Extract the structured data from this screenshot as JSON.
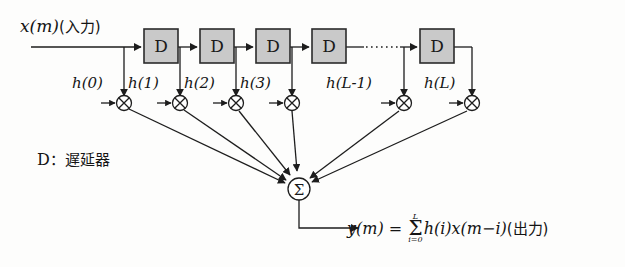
{
  "figure": {
    "type": "block-diagram",
    "title_role": "FIR digital filter (transversal filter) block diagram",
    "input_label": "x(m)(入力)",
    "input_signal": "x(m)",
    "input_annotation": "(入力)",
    "legend": "D：遅延器",
    "legend_symbol": "D",
    "legend_meaning": "遅延器",
    "delay_block_label": "D",
    "delay_blocks": [
      {
        "label": "D",
        "index": 1
      },
      {
        "label": "D",
        "index": 2
      },
      {
        "label": "D",
        "index": 3
      },
      {
        "label": "D",
        "index": 4
      },
      {
        "label": "D",
        "index": 5
      }
    ],
    "ellipsis": "……",
    "coefficients": [
      {
        "label": "h(0)",
        "index": 0
      },
      {
        "label": "h(1)",
        "index": 1
      },
      {
        "label": "h(2)",
        "index": 2
      },
      {
        "label": "h(3)",
        "index": 3
      },
      {
        "label": "h(L-1)",
        "index": 4
      },
      {
        "label": "h(L)",
        "index": 5
      }
    ],
    "multiplier_symbol": "⊗",
    "summation_symbol": "Σ",
    "output": {
      "signal": "y(m)",
      "equals": "=",
      "sum_upper": "L",
      "sum_lower": "i=0",
      "sum_glyph": "Σ",
      "term": "h(i)x(m−i)",
      "annotation": "(出力)",
      "full": "y(m) = Σ(i=0..L) h(i)x(m−i) (出力)"
    },
    "colors": {
      "block_fill": "#c9c9c9",
      "block_stroke": "#2b2b2b",
      "line": "#1d1d1d",
      "background": "#fdfdfc"
    }
  }
}
